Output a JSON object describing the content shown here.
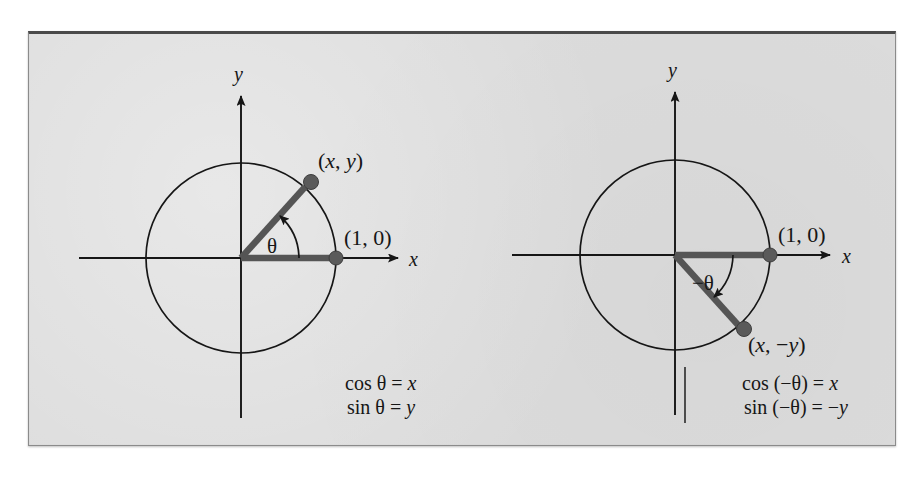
{
  "figure": {
    "background_color": "#dcdcdc",
    "ink_color": "#161616",
    "ray_color": "#555555",
    "dot_color": "#5a5a5a",
    "panels": [
      {
        "id": "positive-angle",
        "axis_x_label": "x",
        "axis_y_label": "y",
        "angle_label": "θ",
        "terminal_point_label": "(x, y)",
        "unit_point_label": "(1, 0)",
        "formulas": [
          "cos θ = x",
          "sin θ = y"
        ],
        "angle_degrees": 48,
        "direction": "counterclockwise",
        "circle": {
          "cx": 241,
          "cy": 258,
          "r": 95
        }
      },
      {
        "id": "negative-angle",
        "axis_x_label": "x",
        "axis_y_label": "y",
        "angle_label": "−θ",
        "terminal_point_label": "(x, −y)",
        "unit_point_label": "(1, 0)",
        "formulas": [
          "cos (−θ) = x",
          "sin (−θ) = −y"
        ],
        "angle_degrees": -48,
        "direction": "clockwise",
        "circle": {
          "cx": 675,
          "cy": 255,
          "r": 95
        }
      }
    ]
  },
  "labels": {
    "left_x_axis": "x",
    "left_y_axis": "y",
    "left_angle": "θ",
    "left_terminal_open": "(",
    "left_terminal_x": "x",
    "left_terminal_comma": ", ",
    "left_terminal_y": "y",
    "left_terminal_close": ")",
    "left_unit_point": "(1, 0)",
    "left_formula_cos_lhs": "cos ",
    "left_formula_cos_theta": "θ",
    "left_formula_cos_eq": " = ",
    "left_formula_cos_rhs": "x",
    "left_formula_sin_lhs": "sin ",
    "left_formula_sin_theta": "θ",
    "left_formula_sin_eq": " = ",
    "left_formula_sin_rhs": "y",
    "right_x_axis": "x",
    "right_y_axis": "y",
    "right_angle": "−θ",
    "right_terminal_open": "(",
    "right_terminal_x": "x",
    "right_terminal_comma": ", −",
    "right_terminal_y": "y",
    "right_terminal_close": ")",
    "right_unit_point": "(1, 0)",
    "right_formula_cos_lhs": "cos (−",
    "right_formula_cos_theta": "θ",
    "right_formula_cos_eq": ") = ",
    "right_formula_cos_rhs": "x",
    "right_formula_sin_lhs": "sin (−",
    "right_formula_sin_theta": "θ",
    "right_formula_sin_eq": ") = −",
    "right_formula_sin_rhs": "y"
  }
}
